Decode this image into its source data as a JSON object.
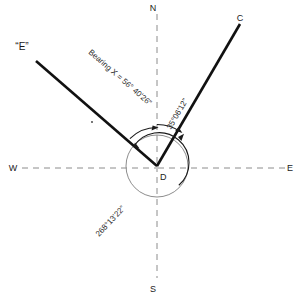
{
  "diagram": {
    "center_label": "D",
    "cardinals": {
      "north": "N",
      "south": "S",
      "east": "E",
      "west": "W"
    },
    "points": [
      {
        "id": "C",
        "label": "C"
      },
      {
        "id": "E",
        "label": "“E”"
      }
    ],
    "angles": [
      {
        "id": "bearing-x",
        "label": "Bearing X = 56° 40'26”",
        "value_degrees": 56,
        "value_minutes": 40,
        "value_seconds": 26
      },
      {
        "id": "angle-c",
        "label": "35°06'12”",
        "value_degrees": 35,
        "value_minutes": 6,
        "value_seconds": 12
      },
      {
        "id": "angle-reflex",
        "label": "268°13'22”",
        "value_degrees": 268,
        "value_minutes": 13,
        "value_seconds": 22
      }
    ],
    "colors": {
      "ray": "#111111",
      "axis": "#8c8c8c",
      "circle": "#8d8d8d",
      "arc": "#1a1a1a",
      "text": "#1a1a1a",
      "background": "#ffffff"
    }
  }
}
